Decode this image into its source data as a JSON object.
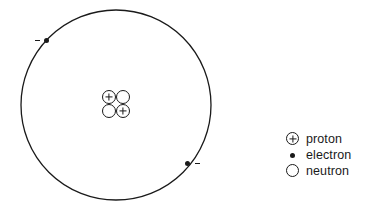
{
  "diagram": {
    "type": "atomic-structure",
    "orbit": {
      "name": "electron-orbit",
      "center_x": 116,
      "center_y": 105,
      "radius": 95,
      "stroke_color": "#1a1a1a"
    },
    "nucleus": {
      "name": "nucleus",
      "proton_count": 2,
      "neutron_count": 2,
      "particles": [
        {
          "kind": "proton",
          "symbol": "+",
          "position": "top-left"
        },
        {
          "kind": "neutron",
          "symbol": "",
          "position": "top-right"
        },
        {
          "kind": "neutron",
          "symbol": "",
          "position": "bottom-left"
        },
        {
          "kind": "proton",
          "symbol": "+",
          "position": "bottom-right"
        }
      ]
    },
    "electrons": [
      {
        "name": "electron-upper-left",
        "charge_mark": "-",
        "x": 47,
        "y": 40
      },
      {
        "name": "electron-lower-right",
        "charge_mark": "-",
        "x": 187,
        "y": 163
      }
    ]
  },
  "legend": {
    "items": [
      {
        "symbol": "proton-symbol",
        "label": "proton"
      },
      {
        "symbol": "electron-symbol",
        "label": "electron"
      },
      {
        "symbol": "neutron-symbol",
        "label": "neutron"
      }
    ]
  },
  "colors": {
    "ink": "#1a1a1a",
    "background": "#ffffff"
  }
}
